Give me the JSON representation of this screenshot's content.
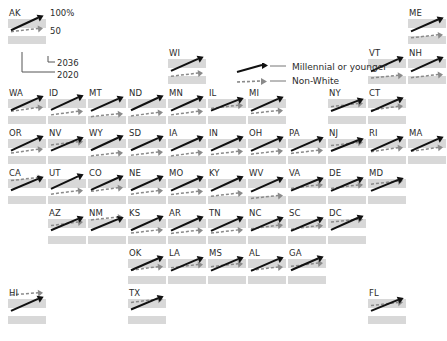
{
  "chart_data": {
    "type": "line",
    "title": "",
    "xlabel": "",
    "ylabel": "",
    "axis_reference": {
      "y_top_label": "100%",
      "y_mid_label": "50",
      "x_end_label": "2036",
      "x_start_label": "2020",
      "ylim": [
        0,
        100
      ],
      "xlim": [
        2020,
        2036
      ],
      "grid": false
    },
    "legend": {
      "position": "top-center",
      "entries": [
        {
          "name": "Millennial or younger",
          "style": "solid-arrow",
          "color": "#111111"
        },
        {
          "name": "Non-White",
          "style": "dashed-arrow",
          "color": "#8a8a8a"
        }
      ]
    },
    "series": [
      {
        "name": "Millennial or younger",
        "style": "solid"
      },
      {
        "name": "Non-White",
        "style": "dashed"
      }
    ],
    "tiles": [
      {
        "label": "AK",
        "col": 1,
        "row": 1,
        "millennial": [
          33,
          68
        ],
        "nonwhite": [
          29,
          38
        ]
      },
      {
        "label": "ME",
        "col": 11,
        "row": 1,
        "millennial": [
          30,
          63
        ],
        "nonwhite": [
          12,
          20
        ]
      },
      {
        "label": "WI",
        "col": 5,
        "row": 2,
        "millennial": [
          31,
          65
        ],
        "nonwhite": [
          16,
          25
        ]
      },
      {
        "label": "VT",
        "col": 10,
        "row": 2,
        "millennial": [
          30,
          64
        ],
        "nonwhite": [
          11,
          19
        ]
      },
      {
        "label": "NH",
        "col": 11,
        "row": 2,
        "millennial": [
          30,
          64
        ],
        "nonwhite": [
          12,
          21
        ]
      },
      {
        "label": "WA",
        "col": 1,
        "row": 3,
        "millennial": [
          33,
          67
        ],
        "nonwhite": [
          30,
          41
        ]
      },
      {
        "label": "ID",
        "col": 2,
        "row": 3,
        "millennial": [
          34,
          69
        ],
        "nonwhite": [
          20,
          30
        ]
      },
      {
        "label": "MT",
        "col": 3,
        "row": 3,
        "millennial": [
          31,
          65
        ],
        "nonwhite": [
          15,
          23
        ]
      },
      {
        "label": "ND",
        "col": 4,
        "row": 3,
        "millennial": [
          33,
          68
        ],
        "nonwhite": [
          17,
          27
        ]
      },
      {
        "label": "MN",
        "col": 5,
        "row": 3,
        "millennial": [
          32,
          66
        ],
        "nonwhite": [
          20,
          30
        ]
      },
      {
        "label": "IL",
        "col": 6,
        "row": 3,
        "millennial": [
          32,
          62
        ],
        "nonwhite": [
          38,
          47
        ]
      },
      {
        "label": "MI",
        "col": 7,
        "row": 3,
        "millennial": [
          31,
          65
        ],
        "nonwhite": [
          24,
          32
        ]
      },
      {
        "label": "NY",
        "col": 9,
        "row": 3,
        "millennial": [
          31,
          60
        ],
        "nonwhite": [
          43,
          52
        ]
      },
      {
        "label": "CT",
        "col": 10,
        "row": 3,
        "millennial": [
          30,
          63
        ],
        "nonwhite": [
          33,
          44
        ]
      },
      {
        "label": "OR",
        "col": 1,
        "row": 4,
        "millennial": [
          32,
          67
        ],
        "nonwhite": [
          25,
          36
        ]
      },
      {
        "label": "NV",
        "col": 2,
        "row": 4,
        "millennial": [
          32,
          64
        ],
        "nonwhite": [
          48,
          57
        ]
      },
      {
        "label": "WY",
        "col": 3,
        "row": 4,
        "millennial": [
          33,
          68
        ],
        "nonwhite": [
          17,
          26
        ]
      },
      {
        "label": "SD",
        "col": 4,
        "row": 4,
        "millennial": [
          33,
          67
        ],
        "nonwhite": [
          19,
          28
        ]
      },
      {
        "label": "IA",
        "col": 5,
        "row": 4,
        "millennial": [
          32,
          66
        ],
        "nonwhite": [
          17,
          27
        ]
      },
      {
        "label": "IN",
        "col": 6,
        "row": 4,
        "millennial": [
          32,
          66
        ],
        "nonwhite": [
          21,
          30
        ]
      },
      {
        "label": "OH",
        "col": 7,
        "row": 4,
        "millennial": [
          31,
          65
        ],
        "nonwhite": [
          22,
          31
        ]
      },
      {
        "label": "PA",
        "col": 8,
        "row": 4,
        "millennial": [
          31,
          64
        ],
        "nonwhite": [
          24,
          33
        ]
      },
      {
        "label": "NJ",
        "col": 9,
        "row": 4,
        "millennial": [
          31,
          61
        ],
        "nonwhite": [
          46,
          55
        ]
      },
      {
        "label": "RI",
        "col": 10,
        "row": 4,
        "millennial": [
          31,
          65
        ],
        "nonwhite": [
          29,
          40
        ]
      },
      {
        "label": "MA",
        "col": 11,
        "row": 4,
        "millennial": [
          31,
          65
        ],
        "nonwhite": [
          30,
          41
        ]
      },
      {
        "label": "CA",
        "col": 1,
        "row": 5,
        "millennial": [
          33,
          65
        ],
        "nonwhite": [
          60,
          69
        ]
      },
      {
        "label": "UT",
        "col": 2,
        "row": 5,
        "millennial": [
          37,
          72
        ],
        "nonwhite": [
          22,
          32
        ]
      },
      {
        "label": "CO",
        "col": 3,
        "row": 5,
        "millennial": [
          34,
          68
        ],
        "nonwhite": [
          30,
          40
        ]
      },
      {
        "label": "NE",
        "col": 4,
        "row": 5,
        "millennial": [
          33,
          67
        ],
        "nonwhite": [
          22,
          32
        ]
      },
      {
        "label": "MO",
        "col": 5,
        "row": 5,
        "millennial": [
          32,
          66
        ],
        "nonwhite": [
          21,
          30
        ]
      },
      {
        "label": "KY",
        "col": 6,
        "row": 5,
        "millennial": [
          31,
          66
        ],
        "nonwhite": [
          16,
          25
        ]
      },
      {
        "label": "WV",
        "col": 7,
        "row": 5,
        "millennial": [
          29,
          63
        ],
        "nonwhite": [
          10,
          18
        ]
      },
      {
        "label": "VA",
        "col": 8,
        "row": 5,
        "millennial": [
          32,
          63
        ],
        "nonwhite": [
          38,
          48
        ]
      },
      {
        "label": "DE",
        "col": 9,
        "row": 5,
        "millennial": [
          31,
          63
        ],
        "nonwhite": [
          38,
          48
        ]
      },
      {
        "label": "MD",
        "col": 10,
        "row": 5,
        "millennial": [
          31,
          62
        ],
        "nonwhite": [
          50,
          59
        ]
      },
      {
        "label": "AZ",
        "col": 2,
        "row": 6,
        "millennial": [
          33,
          65
        ],
        "nonwhite": [
          46,
          56
        ]
      },
      {
        "label": "NM",
        "col": 3,
        "row": 6,
        "millennial": [
          33,
          64
        ],
        "nonwhite": [
          62,
          70
        ]
      },
      {
        "label": "KS",
        "col": 4,
        "row": 6,
        "millennial": [
          33,
          67
        ],
        "nonwhite": [
          25,
          34
        ]
      },
      {
        "label": "AR",
        "col": 5,
        "row": 6,
        "millennial": [
          32,
          66
        ],
        "nonwhite": [
          24,
          33
        ]
      },
      {
        "label": "TN",
        "col": 6,
        "row": 6,
        "millennial": [
          31,
          65
        ],
        "nonwhite": [
          25,
          34
        ]
      },
      {
        "label": "NC",
        "col": 7,
        "row": 6,
        "millennial": [
          32,
          64
        ],
        "nonwhite": [
          37,
          47
        ]
      },
      {
        "label": "SC",
        "col": 8,
        "row": 6,
        "millennial": [
          31,
          63
        ],
        "nonwhite": [
          36,
          46
        ]
      },
      {
        "label": "DC",
        "col": 9,
        "row": 6,
        "millennial": [
          34,
          68
        ],
        "nonwhite": [
          56,
          64
        ]
      },
      {
        "label": "OK",
        "col": 4,
        "row": 7,
        "millennial": [
          33,
          66
        ],
        "nonwhite": [
          33,
          43
        ]
      },
      {
        "label": "LA",
        "col": 5,
        "row": 7,
        "millennial": [
          32,
          64
        ],
        "nonwhite": [
          40,
          49
        ]
      },
      {
        "label": "MS",
        "col": 6,
        "row": 7,
        "millennial": [
          32,
          64
        ],
        "nonwhite": [
          43,
          51
        ]
      },
      {
        "label": "AL",
        "col": 7,
        "row": 7,
        "millennial": [
          31,
          64
        ],
        "nonwhite": [
          33,
          42
        ]
      },
      {
        "label": "GA",
        "col": 8,
        "row": 7,
        "millennial": [
          33,
          66
        ],
        "nonwhite": [
          44,
          53
        ]
      },
      {
        "label": "HI",
        "col": 1,
        "row": 8,
        "millennial": [
          31,
          65
        ],
        "nonwhite": [
          76,
          82
        ]
      },
      {
        "label": "TX",
        "col": 4,
        "row": 8,
        "millennial": [
          35,
          67
        ],
        "nonwhite": [
          55,
          64
        ]
      },
      {
        "label": "FL",
        "col": 10,
        "row": 8,
        "millennial": [
          31,
          62
        ],
        "nonwhite": [
          46,
          55
        ]
      }
    ]
  },
  "colors": {
    "millennial_line": "#111111",
    "nonwhite_line": "#8a8a8a",
    "band_gray": "#d8d8d8",
    "band_white": "#ffffff",
    "text": "#2b2b2b"
  }
}
